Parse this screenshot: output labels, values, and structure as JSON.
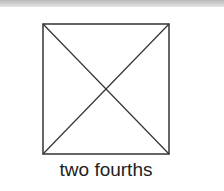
{
  "figure": {
    "shape": "square",
    "divisions": "diagonals",
    "parts_total": 4,
    "stroke_color": "#333333"
  },
  "caption": "two fourths"
}
